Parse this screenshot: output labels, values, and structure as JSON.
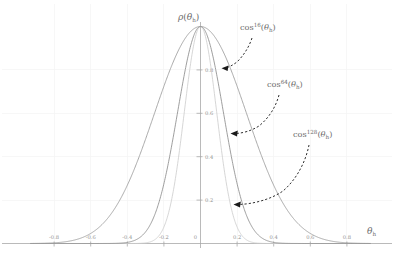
{
  "chart_data": {
    "type": "line",
    "title": "",
    "subtitle": "",
    "xlabel": "θₕ",
    "ylabel": "ρ(θₕ)",
    "xlim": [
      -0.95,
      0.95
    ],
    "ylim": [
      0.0,
      1.04
    ],
    "grid": true,
    "grid_style": "faint light-gray major gridlines",
    "legend": "inline annotations with dashed curved arrows pointing to each curve",
    "legend_position": "right-of-plot, stacked top to bottom",
    "x_ticks": [
      -0.8,
      -0.6,
      -0.4,
      -0.2,
      0,
      0.2,
      0.4,
      0.6,
      0.8
    ],
    "x_tick_labels": [
      "-0.8",
      "-0.6",
      "-0.4",
      "-0.2",
      "0",
      "0.2",
      "0.4",
      "0.6",
      "0.8"
    ],
    "y_ticks": [
      0.2,
      0.4,
      0.6,
      0.8
    ],
    "y_tick_labels": [
      "0.2",
      "0.4",
      "0.6",
      "0.8"
    ],
    "x_unit": "radians",
    "peak_value": 1.0,
    "series": [
      {
        "name": "cos^16(θh)",
        "exponent": 16,
        "color": "#9a9a9a",
        "formula": "cos(theta_h)^16",
        "half_width_at_half_max": 0.2125,
        "x": [
          -0.9,
          -0.85,
          -0.8,
          -0.75,
          -0.7,
          -0.65,
          -0.6,
          -0.55,
          -0.5,
          -0.45,
          -0.4,
          -0.35,
          -0.3,
          -0.25,
          -0.2,
          -0.15,
          -0.1,
          -0.05,
          0.0,
          0.05,
          0.1,
          0.15,
          0.2,
          0.25,
          0.3,
          0.35,
          0.4,
          0.45,
          0.5,
          0.55,
          0.6,
          0.65,
          0.7,
          0.75,
          0.8,
          0.85,
          0.9
        ],
        "values": [
          0.006,
          0.012,
          0.021,
          0.036,
          0.059,
          0.093,
          0.142,
          0.209,
          0.297,
          0.406,
          0.532,
          0.665,
          0.79,
          0.89,
          0.955,
          0.987,
          0.999,
          1.0,
          1.0,
          1.0,
          0.999,
          0.987,
          0.955,
          0.89,
          0.79,
          0.665,
          0.532,
          0.406,
          0.297,
          0.209,
          0.142,
          0.093,
          0.059,
          0.036,
          0.021,
          0.012,
          0.006
        ]
      },
      {
        "name": "cos^64(θh)",
        "exponent": 64,
        "color": "#8d8d8d",
        "formula": "cos(theta_h)^64",
        "half_width_at_half_max": 0.1045,
        "x": [
          -0.5,
          -0.45,
          -0.4,
          -0.35,
          -0.3,
          -0.25,
          -0.2,
          -0.15,
          -0.1,
          -0.05,
          0.0,
          0.05,
          0.1,
          0.15,
          0.2,
          0.25,
          0.3,
          0.35,
          0.4,
          0.45,
          0.5
        ],
        "values": [
          0.001,
          0.003,
          0.008,
          0.02,
          0.049,
          0.111,
          0.231,
          0.401,
          0.605,
          0.818,
          1.0,
          0.818,
          0.605,
          0.401,
          0.231,
          0.111,
          0.049,
          0.02,
          0.008,
          0.003,
          0.001
        ]
      },
      {
        "name": "cos^128(θh)",
        "exponent": 128,
        "color": "#cfcfcf",
        "formula": "cos(theta_h)^128",
        "half_width_at_half_max": 0.0737,
        "x": [
          -0.4,
          -0.35,
          -0.3,
          -0.25,
          -0.2,
          -0.15,
          -0.1,
          -0.05,
          0.0,
          0.05,
          0.1,
          0.15,
          0.2,
          0.25,
          0.3,
          0.35,
          0.4
        ],
        "values": [
          0.0,
          0.0,
          0.002,
          0.012,
          0.053,
          0.161,
          0.366,
          0.669,
          1.0,
          0.669,
          0.366,
          0.161,
          0.053,
          0.012,
          0.002,
          0.0,
          0.0
        ]
      }
    ],
    "annotations": [
      {
        "id": "ann-cos16",
        "text_base": "cos",
        "text_sup": "16",
        "text_arg": "(θₕ)",
        "full": "cos¹⁶(θₕ)",
        "points_to_series": "cos^16(θh)",
        "arrow_style": "dashed curved arrow, left-pointing head"
      },
      {
        "id": "ann-cos64",
        "text_base": "cos",
        "text_sup": "64",
        "text_arg": "(θₕ)",
        "full": "cos⁶⁴(θₕ)",
        "points_to_series": "cos^64(θh)",
        "arrow_style": "dashed curved arrow, left-pointing head"
      },
      {
        "id": "ann-cos128",
        "text_base": "cos",
        "text_sup": "128",
        "text_arg": "(θₕ)",
        "full": "cos¹²⁸(θₕ)",
        "points_to_series": "cos^128(θh)",
        "arrow_style": "dashed curved arrow, left-pointing head"
      }
    ]
  },
  "axes": {
    "y_axis_title": "ρ(θₕ)",
    "y_axis_title_rho": "ρ",
    "y_axis_title_arg": "(θₕ)",
    "x_axis_title": "θₕ",
    "x_axis_title_theta": "θ",
    "x_axis_title_sub": "h"
  },
  "colors": {
    "axis": "#9d9d9d",
    "grid": "#f4f4f4",
    "tick_text": "#8f8f8f",
    "annotation_text": "#6b6b6b",
    "arrow": "#1a1a1a",
    "curve_16": "#9a9a9a",
    "curve_64": "#8d8d8d",
    "curve_128": "#cfcfcf",
    "background": "#ffffff"
  }
}
